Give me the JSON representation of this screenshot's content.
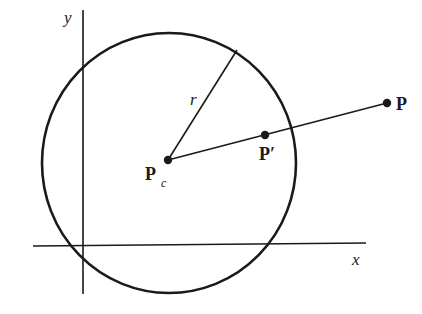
{
  "diagram": {
    "colors": {
      "stroke": "#1a1a1a",
      "background": "#ffffff"
    },
    "axes": {
      "x_label": "x",
      "y_label": "y"
    },
    "circle": {
      "radius_label": "r"
    },
    "points": {
      "center": {
        "label": "P",
        "subscript": "c"
      },
      "projected": {
        "label": "P′"
      },
      "external": {
        "label": "P"
      }
    }
  }
}
